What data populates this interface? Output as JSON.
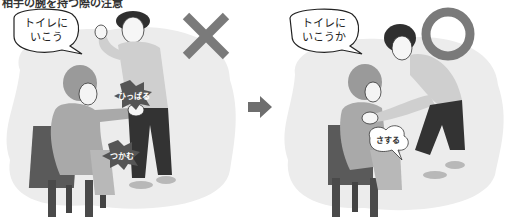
{
  "caption": "相手の腕を持つ際の注意",
  "panels": [
    {
      "id": "bad",
      "speech": "トイレに\nいこう",
      "actions": [
        "ひっぱる",
        "つかむ"
      ],
      "verdict": "cross",
      "verdict_color": "#7a7a7a"
    },
    {
      "id": "good",
      "speech": "トイレに\nいこうか",
      "actions": [
        "さする"
      ],
      "verdict": "circle",
      "verdict_color": "#7a7a7a"
    }
  ],
  "arrow": {
    "icon": "right-arrow-icon",
    "color": "#6e6e6e"
  },
  "colors": {
    "bg_blob": "#eeeeee",
    "shirt": "#c9c9c9",
    "pants": "#3a3a3a",
    "chair": "#555555",
    "skin": "#f4f4f4",
    "seated_person": "#a8a8a8"
  }
}
